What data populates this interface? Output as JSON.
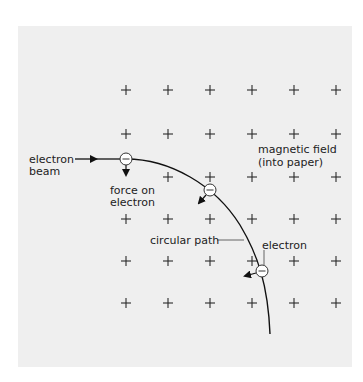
{
  "diagram": {
    "colors": {
      "background": "#efefef",
      "ink": "#222222",
      "electron_fill": "#ffffff"
    },
    "labels": {
      "electron_beam_line1": "electron",
      "electron_beam_line2": "beam",
      "force_line1": "force on",
      "force_line2": "electron",
      "field_line1": "magnetic field",
      "field_line2": "(into paper)",
      "circular_path": "circular path",
      "electron": "electron"
    },
    "electron_symbol": "−",
    "field_symbol": "+",
    "field_grid": {
      "columns_x": [
        126,
        168,
        210,
        252,
        294,
        336
      ],
      "rows_y": [
        90,
        134,
        177,
        219,
        261,
        303
      ]
    },
    "electrons": [
      {
        "x": 126,
        "y": 159,
        "force_to": [
          126,
          176
        ]
      },
      {
        "x": 210,
        "y": 190,
        "force_to": [
          197,
          205
        ]
      },
      {
        "x": 262,
        "y": 271,
        "force_to": [
          243,
          276
        ]
      }
    ]
  }
}
